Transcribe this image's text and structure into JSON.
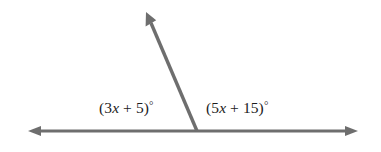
{
  "figure": {
    "type": "geometry-diagram",
    "background_color": "#ffffff",
    "stroke_color": "#6e6e6e",
    "text_color": "#1c1c1c",
    "stroke_width": 3,
    "vertex": {
      "x": 197,
      "y": 131
    },
    "rays": [
      {
        "name": "left-ray",
        "from": {
          "x": 197,
          "y": 131
        },
        "to": {
          "x": 28,
          "y": 131
        },
        "arrow": true
      },
      {
        "name": "right-ray",
        "from": {
          "x": 197,
          "y": 131
        },
        "to": {
          "x": 358,
          "y": 131
        },
        "arrow": true
      },
      {
        "name": "upper-ray",
        "from": {
          "x": 197,
          "y": 131
        },
        "to": {
          "x": 146,
          "y": 12
        },
        "arrow": true
      }
    ]
  },
  "labels": {
    "left": {
      "full_text": "(3x + 5)°",
      "open_paren": "(",
      "coefficient": "3",
      "variable": "x",
      "operator": " + ",
      "constant": "5",
      "close_paren": ")",
      "degree_symbol": "°"
    },
    "right": {
      "full_text": "(5x + 15)°",
      "open_paren": "(",
      "coefficient": "5",
      "variable": "x",
      "operator": " + ",
      "constant": "15",
      "close_paren": ")",
      "degree_symbol": "°"
    }
  }
}
